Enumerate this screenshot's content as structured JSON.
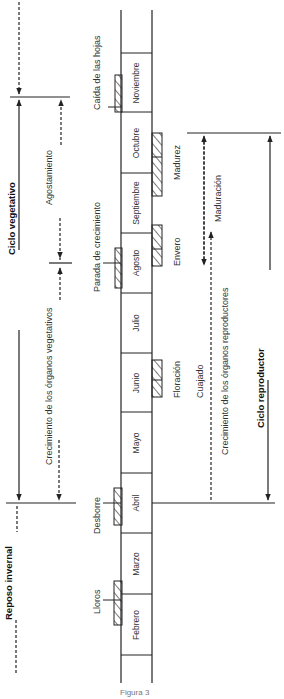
{
  "diagram": {
    "cycles": {
      "vegetativo": "Ciclo vegetativo",
      "reproductor": "Ciclo reproductor",
      "reposo": "Reposo invernal"
    },
    "months": [
      {
        "name": "Noviembre",
        "y0": 53,
        "y1": 112
      },
      {
        "name": "Octubre",
        "y0": 112,
        "y1": 173
      },
      {
        "name": "Septiembre",
        "y0": 173,
        "y1": 233
      },
      {
        "name": "Agosto",
        "y0": 233,
        "y1": 293
      },
      {
        "name": "Julio",
        "y0": 293,
        "y1": 353
      },
      {
        "name": "Junio",
        "y0": 353,
        "y1": 412
      },
      {
        "name": "Mayo",
        "y0": 412,
        "y1": 473
      },
      {
        "name": "Abril",
        "y0": 473,
        "y1": 533
      },
      {
        "name": "Marzo",
        "y0": 533,
        "y1": 594
      },
      {
        "name": "Febrero",
        "y0": 594,
        "y1": 655
      }
    ],
    "vegetative_events": [
      {
        "label": "Caída de las hojas",
        "x": 92,
        "y": 110
      },
      {
        "label": "Parada de crecimiento",
        "x": 92,
        "y": 292
      },
      {
        "label": "Desborre",
        "x": 92,
        "y": 534
      },
      {
        "label": "Lloros",
        "x": 92,
        "y": 614
      }
    ],
    "reproductive_events": [
      {
        "label": "Madurez",
        "x": 172,
        "y": 180
      },
      {
        "label": "Envero",
        "x": 172,
        "y": 266
      },
      {
        "label": "Floración",
        "x": 172,
        "y": 398
      },
      {
        "label": "Cuajado",
        "x": 195,
        "y": 398
      }
    ],
    "phases": {
      "agostamiento": "Agostamiento",
      "crec_vegetativos": "Crecimiento de los órganos vegetativos",
      "maduracion": "Maduración",
      "crec_reproductores": "Crecimiento de los órganos reproductores"
    },
    "caption": "Figura 3"
  }
}
